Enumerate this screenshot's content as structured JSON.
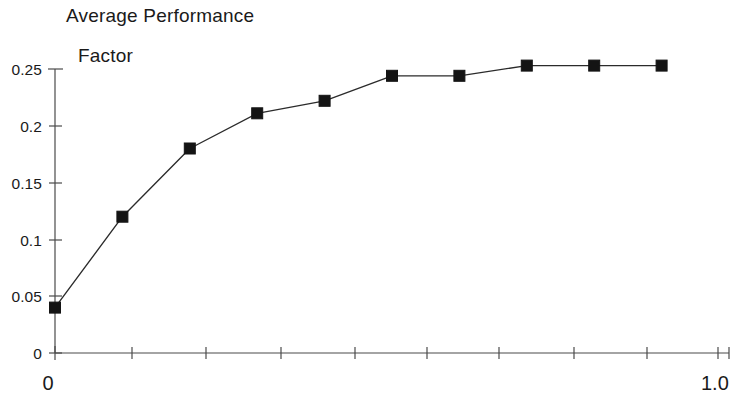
{
  "chart_data": {
    "type": "line",
    "title": "Average Performance Factor",
    "title_lines": [
      "Average Performance",
      "Factor"
    ],
    "xlabel": "",
    "ylabel": "",
    "x": [
      0.0,
      0.1,
      0.2,
      0.3,
      0.4,
      0.5,
      0.6,
      0.7,
      0.8,
      0.9
    ],
    "values": [
      0.04,
      0.12,
      0.18,
      0.211,
      0.222,
      0.244,
      0.244,
      0.253,
      0.253,
      0.253
    ],
    "series": [
      {
        "name": "Average Performance Factor",
        "values": [
          0.04,
          0.12,
          0.18,
          0.211,
          0.222,
          0.244,
          0.244,
          0.253,
          0.253,
          0.253
        ]
      }
    ],
    "xlim": [
      0.0,
      1.0
    ],
    "ylim": [
      0.0,
      0.25
    ],
    "y_ticks": [
      0,
      0.05,
      0.1,
      0.15,
      0.2,
      0.25
    ],
    "y_tick_labels": [
      "0",
      "0.05",
      "0.1",
      "0.15",
      "0.2",
      "0.25"
    ],
    "x_ticks": [
      0.0,
      0.1,
      0.2,
      0.3,
      0.4,
      0.5,
      0.6,
      0.7,
      0.8,
      0.9,
      1.0
    ],
    "x_tick_labels": [
      "0",
      "",
      "",
      "",
      "",
      "",
      "",
      "",
      "",
      "",
      "1.0"
    ],
    "x_axis_label_left": "0",
    "x_axis_label_right": "1.0",
    "grid": false,
    "legend": false,
    "marker": "filled-square",
    "line_color": "#2b2b2b",
    "marker_color": "#141414",
    "axis_color": "#4a4a4a",
    "background_color": "#ffffff"
  }
}
